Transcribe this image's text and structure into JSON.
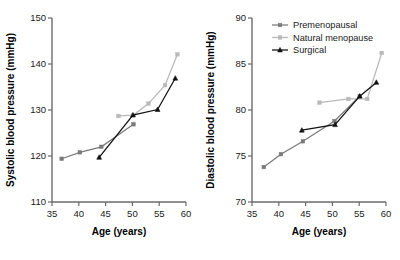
{
  "figure": {
    "panels": [
      "systolic",
      "diastolic"
    ]
  },
  "series_meta": [
    {
      "key": "premenopausal",
      "label": "Premenopausal",
      "color": "#7a7a7a",
      "marker": "square"
    },
    {
      "key": "natural_menopause",
      "label": "Natural menopause",
      "color": "#b9b9b9",
      "marker": "square"
    },
    {
      "key": "surgical",
      "label": "Surgical",
      "color": "#111111",
      "marker": "triangle"
    }
  ],
  "legend": {
    "position": "top-left-of-right-panel",
    "entries": [
      "Premenopausal",
      "Natural menopause",
      "Surgical"
    ]
  },
  "chart_data": [
    {
      "type": "line",
      "id": "systolic",
      "title": "",
      "xlabel": "Age (years)",
      "ylabel": "Systolic blood pressure (mmHg)",
      "xlim": [
        35,
        60
      ],
      "ylim": [
        110,
        150
      ],
      "xticks": [
        35,
        40,
        45,
        50,
        55,
        60
      ],
      "yticks": [
        110,
        120,
        130,
        140,
        150
      ],
      "xticklabels": [
        "35",
        "40",
        "45",
        "50",
        "55",
        "60"
      ],
      "yticklabels": [
        "110",
        "120",
        "130",
        "140",
        "150"
      ],
      "grid": false,
      "legend_shown": false,
      "series": [
        {
          "name": "Premenopausal",
          "color": "#7a7a7a",
          "x": [
            36.8,
            40.2,
            44.2,
            50.2
          ],
          "y": [
            119.4,
            120.8,
            122.0,
            126.9
          ]
        },
        {
          "name": "Natural menopause",
          "color": "#b9b9b9",
          "x": [
            47.4,
            50.2,
            53.0,
            56.1,
            58.4
          ],
          "y": [
            128.7,
            128.9,
            131.4,
            135.4,
            142.1
          ]
        },
        {
          "name": "Surgical",
          "color": "#111111",
          "x": [
            43.8,
            50.1,
            54.7,
            58.0
          ],
          "y": [
            119.7,
            128.9,
            130.1,
            136.9
          ]
        }
      ]
    },
    {
      "type": "line",
      "id": "diastolic",
      "title": "",
      "xlabel": "Age (years)",
      "ylabel": "Diastolic blood pressure (mmHg)",
      "xlim": [
        35,
        60
      ],
      "ylim": [
        70,
        90
      ],
      "xticks": [
        35,
        40,
        45,
        50,
        55,
        60
      ],
      "yticks": [
        70,
        75,
        80,
        85,
        90
      ],
      "xticklabels": [
        "35",
        "40",
        "45",
        "50",
        "55",
        "60"
      ],
      "yticklabels": [
        "70",
        "75",
        "80",
        "85",
        "90"
      ],
      "grid": false,
      "legend_shown": true,
      "series": [
        {
          "name": "Premenopausal",
          "color": "#7a7a7a",
          "x": [
            37.2,
            40.4,
            44.5,
            50.4,
            55.1
          ],
          "y": [
            73.8,
            75.2,
            76.6,
            78.8,
            81.5
          ]
        },
        {
          "name": "Natural menopause",
          "color": "#b9b9b9",
          "x": [
            47.6,
            53.0,
            56.5,
            59.2
          ],
          "y": [
            80.8,
            81.2,
            81.2,
            86.2
          ]
        },
        {
          "name": "Surgical",
          "color": "#111111",
          "x": [
            44.3,
            50.5,
            55.1,
            58.2
          ],
          "y": [
            77.8,
            78.4,
            81.5,
            83.0
          ]
        }
      ]
    }
  ]
}
